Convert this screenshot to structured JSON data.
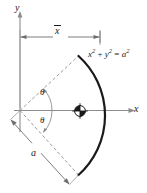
{
  "figure": {
    "kind": "geometry-diagram",
    "background_color": "#ffffff",
    "stroke_color": "#1a1a1a",
    "axis_color": "#808080",
    "dashed_color": "#999999",
    "labels": {
      "y_axis": "y",
      "x_axis": "x",
      "xbar": "x",
      "theta_upper": "θ",
      "theta_lower": "θ",
      "radius": "a"
    },
    "equation": {
      "x_term": "x",
      "x_exp": "2",
      "plus": " + ",
      "y_term": "y",
      "y_exp": "2",
      "equals": " = ",
      "a_term": "a",
      "a_exp": "2"
    },
    "geometry": {
      "origin_x": 20,
      "origin_y": 110,
      "radius_px": 80,
      "half_angle_deg": 43,
      "centroid_x": 80,
      "centroid_y": 111,
      "xbar_dim_y": 37,
      "xbar_start_x": 20,
      "xbar_end_x": 100
    }
  }
}
